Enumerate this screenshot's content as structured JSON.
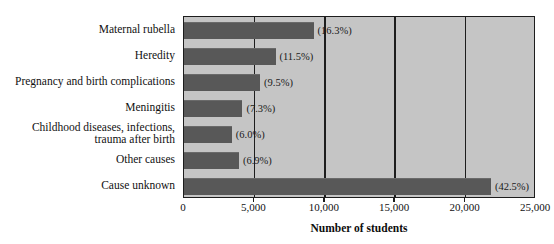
{
  "chart_data": {
    "type": "bar",
    "orientation": "horizontal",
    "title": "",
    "xlabel": "Number of students",
    "ylabel": "",
    "xlim": [
      0,
      25000
    ],
    "grid": true,
    "legend": false,
    "categories": [
      "Maternal rubella",
      "Heredity",
      "Pregnancy and birth complications",
      "Meningitis",
      "Childhood diseases, infections,\ntrauma after birth",
      "Other causes",
      "Cause unknown"
    ],
    "values": [
      9200,
      6500,
      5400,
      4150,
      3400,
      3900,
      21800
    ],
    "data_labels": [
      "(16.3%)",
      "(11.5%)",
      "(9.5%)",
      "(7.3%)",
      "(6.0%)",
      "(6.9%)",
      "(42.5%)"
    ],
    "percentages": [
      16.3,
      11.5,
      9.5,
      7.3,
      6.0,
      6.9,
      42.5
    ],
    "xticks": [
      0,
      5000,
      10000,
      15000,
      20000,
      25000
    ],
    "xtick_labels": [
      "0",
      "5,000",
      "10,000",
      "15,000",
      "20,000",
      "25,000"
    ],
    "colors": {
      "bar": "#585858",
      "plot_background": "#c5c5c5",
      "axis": "#1d1d1d",
      "text": "#111111",
      "page_background": "#ffffff"
    }
  }
}
